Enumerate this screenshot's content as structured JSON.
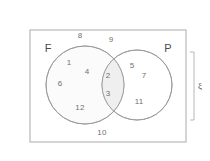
{
  "diagram": {
    "type": "venn-two-set",
    "title": "",
    "universe_label": "ξ",
    "sets": [
      {
        "id": "F",
        "label": "F",
        "label_x": 48,
        "label_y": 48
      },
      {
        "id": "P",
        "label": "P",
        "label_y": 48,
        "label_x": 168
      }
    ],
    "regions": {
      "outside_both": {
        "name": "universe-only",
        "values": [
          8,
          9,
          10
        ]
      },
      "f_only": {
        "name": "f-only",
        "values": [
          1,
          4,
          6,
          12
        ]
      },
      "intersection": {
        "name": "f-and-p",
        "values": [
          2,
          3
        ]
      },
      "p_only": {
        "name": "p-only",
        "values": [
          5,
          7,
          11
        ]
      }
    },
    "elements": [
      {
        "value": "8",
        "region": "outside_both",
        "x": 80,
        "y": 36
      },
      {
        "value": "9",
        "region": "outside_both",
        "x": 111,
        "y": 40
      },
      {
        "value": "1",
        "region": "f_only",
        "x": 69,
        "y": 63
      },
      {
        "value": "4",
        "region": "f_only",
        "x": 87,
        "y": 72
      },
      {
        "value": "6",
        "region": "f_only",
        "x": 60,
        "y": 84
      },
      {
        "value": "12",
        "region": "f_only",
        "x": 80,
        "y": 108
      },
      {
        "value": "2",
        "region": "intersection",
        "x": 108,
        "y": 76
      },
      {
        "value": "3",
        "region": "intersection",
        "x": 108,
        "y": 94
      },
      {
        "value": "5",
        "region": "p_only",
        "x": 132,
        "y": 66
      },
      {
        "value": "7",
        "region": "p_only",
        "x": 144,
        "y": 76
      },
      {
        "value": "11",
        "region": "p_only",
        "x": 139,
        "y": 102
      },
      {
        "value": "10",
        "region": "outside_both",
        "x": 102,
        "y": 133
      }
    ],
    "geometry": {
      "rect": {
        "x": 30,
        "y": 30,
        "width": 156,
        "height": 112
      },
      "circle_f": {
        "cx": 85,
        "cy": 85,
        "r": 39
      },
      "circle_p": {
        "cx": 137,
        "cy": 85,
        "r": 35
      },
      "universe_bracket": {
        "x": 192,
        "y_top": 52,
        "y_bottom": 120
      },
      "universe_label_pos": {
        "x": 200,
        "y": 86
      }
    },
    "colors": {
      "stroke": "#999999",
      "rect_stroke": "#aaaaaa",
      "fill_f": "#fbfbfb",
      "fill_intersection": "#f2f2f2",
      "text": "#6f6f6f",
      "set_text": "#4a4a4a",
      "background": "#ffffff"
    }
  }
}
